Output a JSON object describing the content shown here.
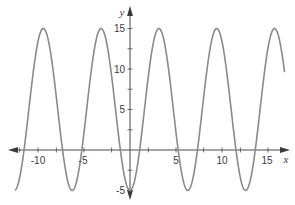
{
  "chart_data": {
    "type": "line",
    "title": "",
    "xlabel": "x",
    "ylabel": "y",
    "function": "y = 5 - 10cos(x)",
    "xlim": [
      -13,
      17
    ],
    "ylim": [
      -5,
      15
    ],
    "grid": false,
    "legend": null,
    "x_ticks": [
      -10,
      -5,
      5,
      10,
      15
    ],
    "x_minor_ticks": [
      -12,
      -10,
      -8,
      -5,
      -2,
      2,
      5,
      8,
      10,
      12,
      15
    ],
    "y_ticks": [
      -5,
      5,
      10,
      15
    ],
    "y_minor_ticks": [
      -5,
      -2.5,
      2.5,
      5,
      7.5,
      10,
      12.5,
      15
    ],
    "series": [
      {
        "name": "y = 5 - 10cos(x)",
        "x_range": [
          -12.5,
          16.8
        ],
        "maxima": [
          {
            "x": -9.42,
            "y": 15
          },
          {
            "x": -3.14,
            "y": 15
          },
          {
            "x": 3.14,
            "y": 15
          },
          {
            "x": 9.42,
            "y": 15
          },
          {
            "x": 15.71,
            "y": 15
          }
        ],
        "minima": [
          {
            "x": -6.28,
            "y": -5
          },
          {
            "x": 0,
            "y": -5
          },
          {
            "x": 6.28,
            "y": -5
          },
          {
            "x": 12.57,
            "y": -5
          }
        ],
        "color": "#8a8a8a"
      }
    ],
    "colors": {
      "curve": "#8a8a8a",
      "axis": "#4a4a4a",
      "text": "#3a3a3a"
    }
  },
  "labels": {
    "x_axis": "x",
    "y_axis": "y",
    "x_tick_labels": [
      "-10",
      "-5",
      "5",
      "10",
      "15"
    ],
    "y_tick_labels": [
      "15",
      "10",
      "5",
      "-5"
    ]
  }
}
